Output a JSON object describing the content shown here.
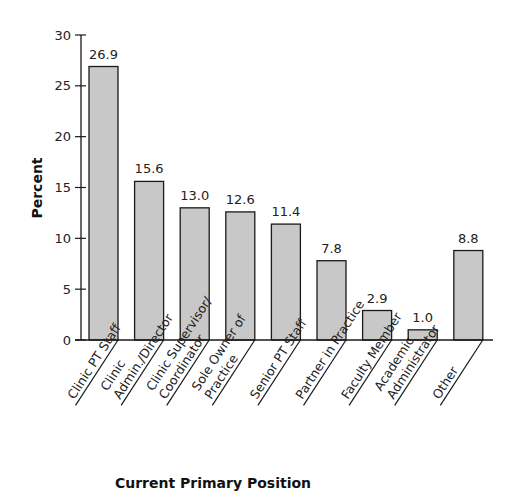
{
  "chart_data": {
    "type": "bar",
    "title": "",
    "xlabel": "Current Primary Position",
    "ylabel": "Percent",
    "ylim": [
      0,
      30
    ],
    "yticks": [
      0,
      5,
      10,
      15,
      20,
      25,
      30
    ],
    "grid": false,
    "legend": null,
    "categories": [
      "Clinic PT Staff",
      "Clinic Admin./Director",
      "Clinic Supervisor/ Coordinator",
      "Sole Owner of Practice",
      "Senior PT Staff",
      "Partner in Practice",
      "Faculty Member",
      "Academic Administrator",
      "Other"
    ],
    "category_label_lines": [
      [
        "Clinic PT Staff"
      ],
      [
        "Clinic",
        "Admin./Director"
      ],
      [
        "Clinic Supervisor/",
        "Coordinator"
      ],
      [
        "Sole Owner of",
        "Practice"
      ],
      [
        "Senior PT Staff"
      ],
      [
        "Partner in Practice"
      ],
      [
        "Faculty Member"
      ],
      [
        "Academic",
        "Administrator"
      ],
      [
        "Other"
      ]
    ],
    "values": [
      26.9,
      15.6,
      13.0,
      12.6,
      11.4,
      7.8,
      2.9,
      1.0,
      8.8
    ],
    "value_labels": [
      "26.9",
      "15.6",
      "13.0",
      "12.6",
      "11.4",
      "7.8",
      "2.9",
      "1.0",
      "8.8"
    ],
    "colors": {
      "bar_fill": "#c8c8c8",
      "bar_stroke": "#1a1a1a",
      "axis": "#1a1a1a"
    }
  }
}
